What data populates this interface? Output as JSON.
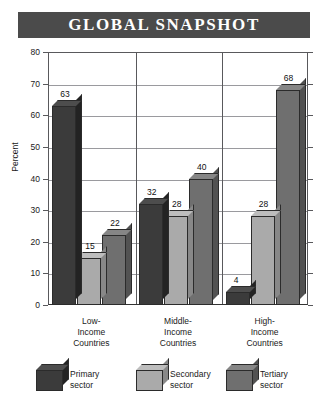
{
  "title": "GLOBAL SNAPSHOT",
  "colors": {
    "banner_bg": "#4b4b4b",
    "banner_text": "#ffffff",
    "primary": "#3b3b3b",
    "primary_top": "#4d4d4d",
    "primary_side": "#232323",
    "secondary": "#aaaaaa",
    "secondary_top": "#bdbdbd",
    "secondary_side": "#888888",
    "tertiary": "#6f6f6f",
    "tertiary_top": "#868686",
    "tertiary_side": "#525252",
    "grid": "#9a9a9e",
    "axis": "#59595c"
  },
  "axis": {
    "y_label": "Percent",
    "y_ticks": [
      "0",
      "10",
      "20",
      "30",
      "40",
      "50",
      "60",
      "70",
      "80"
    ]
  },
  "legend": {
    "items": [
      {
        "label_line1": "Primary",
        "label_line2": "sector",
        "series": "primary"
      },
      {
        "label_line1": "Secondary",
        "label_line2": "sector",
        "series": "secondary"
      },
      {
        "label_line1": "Tertiary",
        "label_line2": "sector",
        "series": "tertiary"
      }
    ]
  },
  "categories_multiline": [
    [
      "Low-",
      "Income",
      "Countries"
    ],
    [
      "Middle-",
      "Income",
      "Countries"
    ],
    [
      "High-",
      "Income",
      "Countries"
    ]
  ],
  "chart_data": {
    "type": "bar",
    "title": "GLOBAL SNAPSHOT",
    "xlabel": "",
    "ylabel": "Percent",
    "ylim": [
      0,
      80
    ],
    "ytick_step": 10,
    "grid": true,
    "legend_position": "bottom",
    "categories": [
      "Low-Income Countries",
      "Middle-Income Countries",
      "High-Income Countries"
    ],
    "series": [
      {
        "name": "Primary sector",
        "values": [
          63,
          32,
          4
        ]
      },
      {
        "name": "Secondary sector",
        "values": [
          15,
          28,
          28
        ]
      },
      {
        "name": "Tertiary sector",
        "values": [
          22,
          40,
          68
        ]
      }
    ]
  }
}
